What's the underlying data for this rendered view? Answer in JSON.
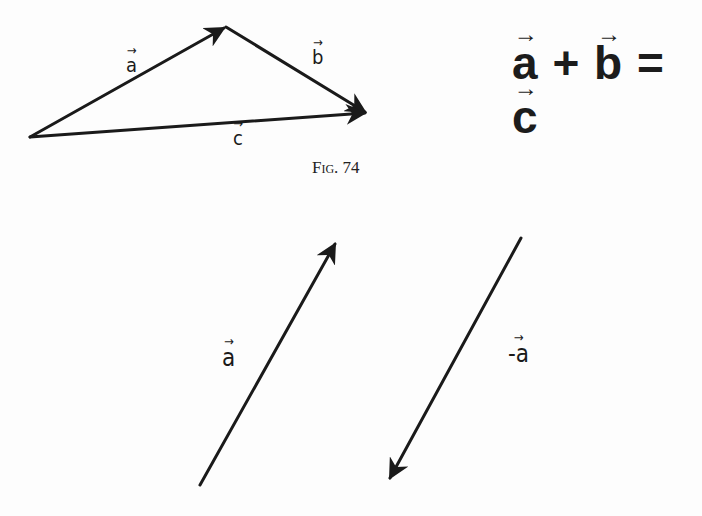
{
  "figure_caption": "Fig. 74",
  "equation": {
    "a": "a",
    "plus": "+",
    "b": "b",
    "equals": "=",
    "c": "c"
  },
  "top_vectors": {
    "a": {
      "label": "a",
      "from": [
        30,
        137
      ],
      "to": [
        226,
        27
      ]
    },
    "b": {
      "label": "b",
      "from": [
        226,
        27
      ],
      "to": [
        367,
        113
      ]
    },
    "c": {
      "label": "c",
      "from": [
        30,
        137
      ],
      "to": [
        367,
        113
      ]
    }
  },
  "bottom_vectors": {
    "a": {
      "label": "a",
      "from": [
        200,
        485
      ],
      "to": [
        336,
        242
      ]
    },
    "neg_a": {
      "label": "-a",
      "from": [
        521,
        238
      ],
      "to": [
        388,
        480
      ]
    }
  },
  "arrow_glyph": "→",
  "colors": {
    "ink": "#1a1a1a",
    "paper": "#fdfdfd"
  }
}
